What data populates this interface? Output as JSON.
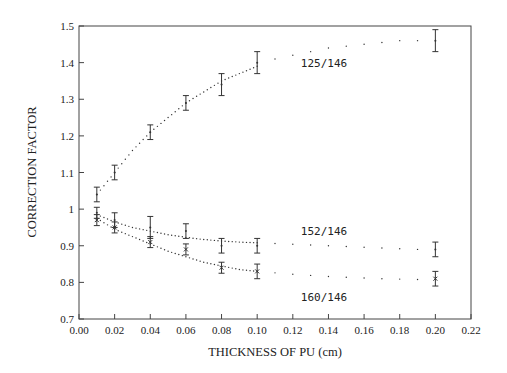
{
  "chart_data": {
    "type": "scatter",
    "title": "",
    "xlabel": "THICKNESS OF PU (cm)",
    "ylabel": "CORRECTION FACTOR",
    "xlim": [
      0.0,
      0.22
    ],
    "ylim": [
      0.7,
      1.5
    ],
    "xticks": [
      "0.00",
      "0.02",
      "0.04",
      "0.06",
      "0.08",
      "0.10",
      "0.12",
      "0.14",
      "0.16",
      "0.18",
      "0.20",
      "0.22"
    ],
    "yticks": [
      "0.7",
      "0.8",
      "0.9",
      "1",
      "1.1",
      "1.2",
      "1.3",
      "1.4",
      "1.5"
    ],
    "grid": false,
    "legend": "inline labels",
    "series": [
      {
        "name": "125/146",
        "marker": "error-bar",
        "x": [
          0.01,
          0.02,
          0.04,
          0.06,
          0.08,
          0.1,
          0.2
        ],
        "y": [
          1.04,
          1.1,
          1.21,
          1.29,
          1.34,
          1.4,
          1.46
        ],
        "err": [
          0.02,
          0.02,
          0.02,
          0.02,
          0.03,
          0.03,
          0.03
        ],
        "fit_x": [
          0.01,
          0.02,
          0.03,
          0.04,
          0.05,
          0.06,
          0.07,
          0.08,
          0.09,
          0.1,
          0.11,
          0.12,
          0.13,
          0.14,
          0.15,
          0.16,
          0.17,
          0.18,
          0.19,
          0.2
        ],
        "fit_y": [
          1.04,
          1.1,
          1.16,
          1.21,
          1.25,
          1.29,
          1.32,
          1.35,
          1.37,
          1.39,
          1.41,
          1.42,
          1.43,
          1.44,
          1.445,
          1.45,
          1.455,
          1.46,
          1.46,
          1.46
        ],
        "label_pos": [
          0.12,
          1.38
        ]
      },
      {
        "name": "152/146",
        "marker": "error-bar",
        "x": [
          0.01,
          0.02,
          0.04,
          0.06,
          0.08,
          0.1,
          0.2
        ],
        "y": [
          0.99,
          0.97,
          0.95,
          0.94,
          0.9,
          0.9,
          0.89
        ],
        "err": [
          0.015,
          0.02,
          0.03,
          0.02,
          0.02,
          0.02,
          0.02
        ],
        "fit_x": [
          0.01,
          0.02,
          0.03,
          0.04,
          0.05,
          0.06,
          0.07,
          0.08,
          0.09,
          0.1,
          0.11,
          0.12,
          0.13,
          0.14,
          0.15,
          0.16,
          0.17,
          0.18,
          0.19,
          0.2
        ],
        "fit_y": [
          0.985,
          0.965,
          0.95,
          0.94,
          0.93,
          0.923,
          0.917,
          0.913,
          0.91,
          0.908,
          0.906,
          0.904,
          0.902,
          0.9,
          0.898,
          0.896,
          0.894,
          0.892,
          0.89,
          0.89
        ],
        "label_pos": [
          0.12,
          0.92
        ]
      },
      {
        "name": "160/146",
        "marker": "x-with-error-bar",
        "x": [
          0.01,
          0.02,
          0.04,
          0.06,
          0.08,
          0.1,
          0.2
        ],
        "y": [
          0.97,
          0.95,
          0.91,
          0.89,
          0.84,
          0.83,
          0.81
        ],
        "err": [
          0.015,
          0.015,
          0.015,
          0.015,
          0.015,
          0.02,
          0.02
        ],
        "fit_x": [
          0.01,
          0.02,
          0.03,
          0.04,
          0.05,
          0.06,
          0.07,
          0.08,
          0.09,
          0.1,
          0.11,
          0.12,
          0.13,
          0.14,
          0.15,
          0.16,
          0.17,
          0.18,
          0.19,
          0.2
        ],
        "fit_y": [
          0.975,
          0.945,
          0.925,
          0.905,
          0.885,
          0.87,
          0.855,
          0.845,
          0.835,
          0.83,
          0.826,
          0.822,
          0.819,
          0.816,
          0.814,
          0.812,
          0.81,
          0.809,
          0.808,
          0.807
        ],
        "label_pos": [
          0.12,
          0.74
        ]
      }
    ]
  }
}
